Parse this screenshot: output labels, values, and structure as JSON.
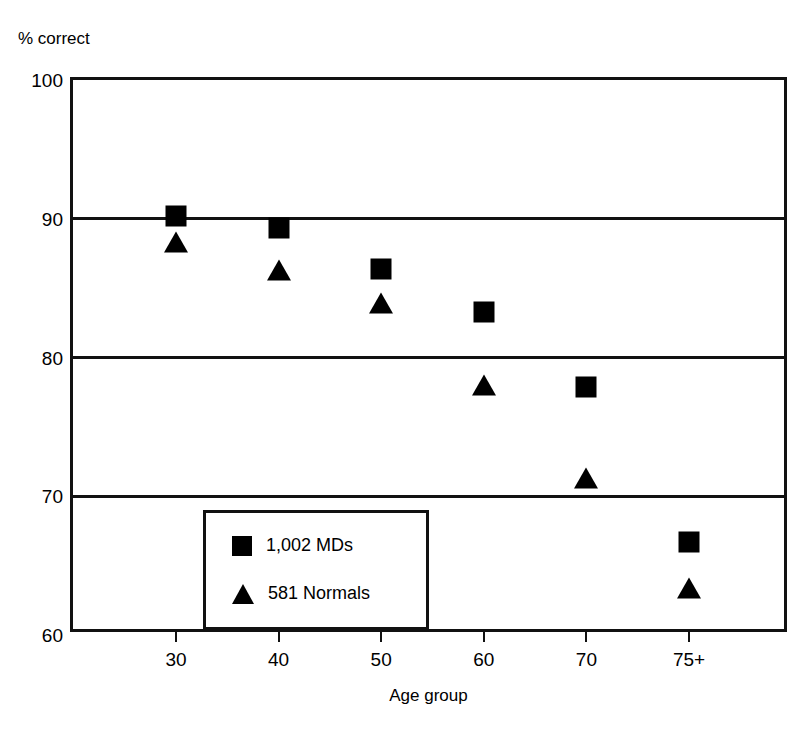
{
  "figure": {
    "y_axis_caption": "% correct",
    "x_axis_title": "Age group"
  },
  "legend": {
    "entries": [
      {
        "marker": "square-marker",
        "label": "1,002 MDs"
      },
      {
        "marker": "triangle-marker",
        "label": "581 Normals"
      }
    ]
  },
  "chart_data": {
    "type": "scatter",
    "title": "",
    "subtitle": "",
    "xlabel": "Age group",
    "ylabel": "% correct",
    "categories": [
      "30",
      "40",
      "50",
      "60",
      "70",
      "75+"
    ],
    "ylim": [
      60,
      100
    ],
    "yticks": [
      60,
      70,
      80,
      90,
      100
    ],
    "ytick_labels": [
      "60",
      "70",
      "80",
      "90",
      "100"
    ],
    "xtick_labels": [
      "30",
      "40",
      "50",
      "60",
      "70",
      "75+"
    ],
    "grid": "horizontal",
    "legend_position": "inside-lower-left",
    "series": [
      {
        "name": "1,002 MDs",
        "marker": "square",
        "color": "#000000",
        "values": [
          90.2,
          89.3,
          86.4,
          83.3,
          77.9,
          66.7
        ]
      },
      {
        "name": "581 Normals",
        "marker": "triangle",
        "color": "#000000",
        "values": [
          88.3,
          86.3,
          83.9,
          78.0,
          71.3,
          63.4
        ]
      }
    ],
    "annotations": []
  },
  "colors": {
    "marker": "#000000",
    "axis": "#111111",
    "background": "#ffffff"
  }
}
